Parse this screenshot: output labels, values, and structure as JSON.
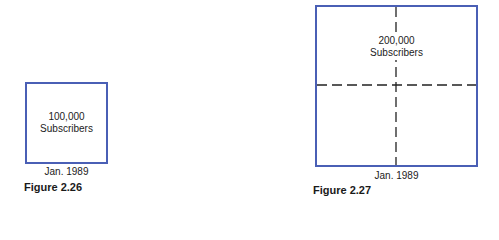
{
  "figures": [
    {
      "id": "figure-2-26",
      "caption": "Figure 2.26",
      "box_label_line1": "100,000",
      "box_label_line2": "Subscribers",
      "date": "Jan. 1989",
      "subscribers": 100000,
      "divided_into_quadrants": false
    },
    {
      "id": "figure-2-27",
      "caption": "Figure 2.27",
      "box_label_line1": "200,000",
      "box_label_line2": "Subscribers",
      "date": "Jan. 1989",
      "subscribers": 200000,
      "divided_into_quadrants": true
    }
  ],
  "colors": {
    "box_border": "#4a5fb5",
    "text": "#1a1a1a",
    "dashed_line": "#222222",
    "background": "#ffffff"
  }
}
